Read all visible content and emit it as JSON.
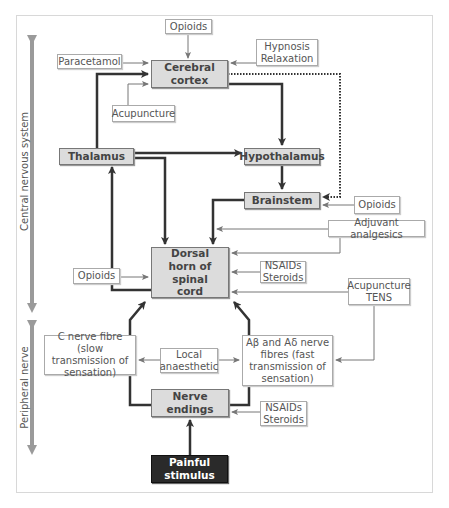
{
  "side_labels": {
    "cns": "Central nervous system",
    "peripheral": "Peripheral nerve"
  },
  "nodes": {
    "cerebral_cortex": "Cerebral cortex",
    "thalamus": "Thalamus",
    "hypothalamus": "Hypothalamus",
    "brainstem": "Brainstem",
    "dorsal_horn": "Dorsal horn of spinal cord",
    "c_fibre": "C nerve fibre (slow transmission of sensation)",
    "a_fibres": "Aβ and Aδ nerve fibres (fast transmission of sensation)",
    "nerve_endings": "Nerve endings",
    "painful_stimulus": "Painful stimulus"
  },
  "interventions": {
    "opioids_top": "Opioids",
    "paracetamol": "Paracetamol",
    "hypnosis": "Hypnosis Relaxation",
    "acupuncture_top": "Acupuncture",
    "opioids_brainstem": "Opioids",
    "adjuvant": "Adjuvant analgesics",
    "opioids_dorsal": "Opioids",
    "nsaids_dorsal": "NSAIDs Steroids",
    "acupuncture_tens": "Acupuncture TENS",
    "local_anaesthetic": "Local anaesthetic",
    "nsaids_endings": "NSAIDs Steroids"
  },
  "colors": {
    "core_fill": "#dcdcdc",
    "stimulus_fill": "#2a2a2a",
    "axis_arrow": "#9a9a9a",
    "thick_line": "#333333",
    "thin_line": "#777777"
  }
}
